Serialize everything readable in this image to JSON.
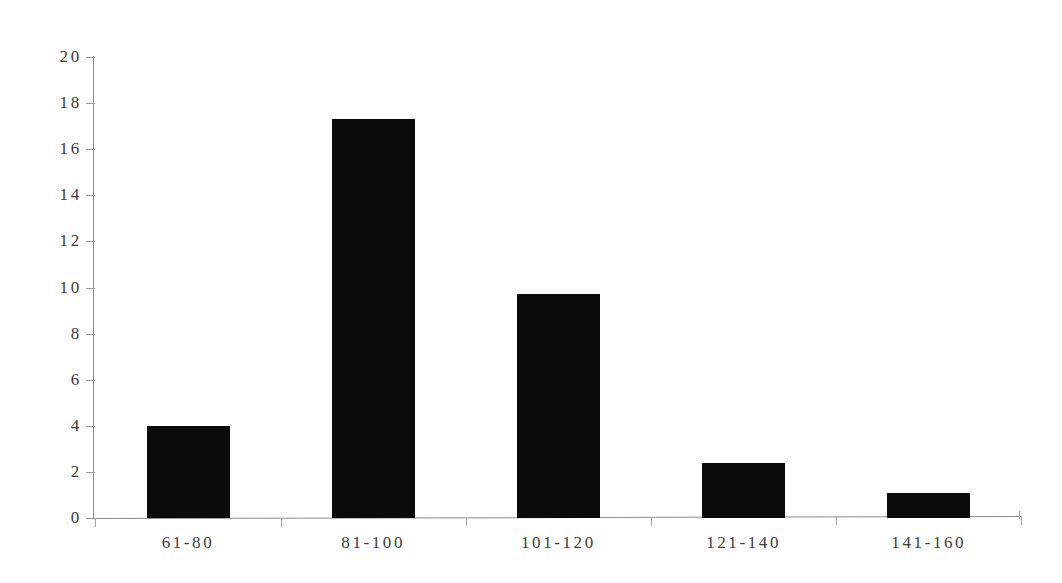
{
  "chart_data": {
    "type": "bar",
    "title": "",
    "subtitle": "",
    "xlabel": "",
    "ylabel": "",
    "categories": [
      "61-80",
      "81-100",
      "101-120",
      "121-140",
      "141-160"
    ],
    "values": [
      4.0,
      17.3,
      9.7,
      2.4,
      1.1
    ],
    "series": [
      {
        "name": "Frequency",
        "values": [
          4.0,
          17.3,
          9.7,
          2.4,
          1.1
        ]
      }
    ],
    "ylim": [
      0,
      20
    ],
    "ytick_labels": [
      "0",
      "2",
      "4",
      "6",
      "8",
      "10",
      "12",
      "14",
      "16",
      "18",
      "20"
    ],
    "ytick_values": [
      0,
      2,
      4,
      6,
      8,
      10,
      12,
      14,
      16,
      18,
      20
    ],
    "grid": false,
    "legend": false,
    "legend_position": "none",
    "bar_color": "#0b0b0b",
    "axis_color": "#8d8d8d",
    "text_color": "#3b3b3b",
    "background_color": "#ffffff",
    "annotations": []
  },
  "axes": {
    "y_axis_name": "y-axis",
    "x_axis_name": "x-axis"
  }
}
